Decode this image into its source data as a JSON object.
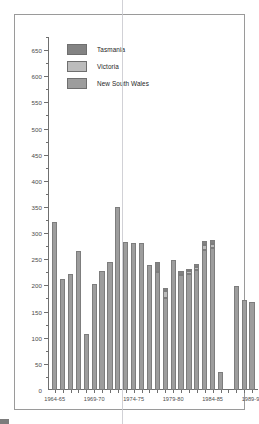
{
  "chart_data": {
    "type": "bar",
    "stacked": true,
    "title": "",
    "xlabel": "",
    "ylabel": "",
    "ylim": [
      0,
      675
    ],
    "ytick_step": 50,
    "yminor_step": 25,
    "grid": false,
    "legend_position": "top-left",
    "ytick_labels": [
      "50",
      "100",
      "150",
      "200",
      "250",
      "300",
      "350",
      "400",
      "450",
      "500",
      "550",
      "600",
      "650"
    ],
    "ytick_values": [
      50,
      100,
      150,
      200,
      250,
      300,
      350,
      400,
      450,
      500,
      550,
      600,
      650
    ],
    "xtick_labels": [
      "1964-65",
      "1969-70",
      "1974-75",
      "1979-80",
      "1984-85",
      "1989-90"
    ],
    "xtick_index": [
      0,
      5,
      10,
      15,
      20,
      25
    ],
    "categories": [
      "1964-65",
      "1965-66",
      "1966-67",
      "1967-68",
      "1968-69",
      "1969-70",
      "1970-71",
      "1971-72",
      "1972-73",
      "1973-74",
      "1974-75",
      "1975-76",
      "1976-77",
      "1977-78",
      "1978-79",
      "1979-80",
      "1980-81",
      "1981-82",
      "1982-83",
      "1983-84",
      "1984-85",
      "1985-86",
      "1986-87",
      "1987-88",
      "1988-89",
      "1989-90"
    ],
    "series": [
      {
        "name": "New South Wales",
        "color": "#9d9d9d",
        "values": [
          322,
          212,
          222,
          265,
          107,
          203,
          228,
          245,
          350,
          283,
          282,
          282,
          240,
          226,
          176,
          249,
          219,
          222,
          230,
          268,
          272,
          34,
          0,
          198,
          172,
          168
        ]
      },
      {
        "name": "Victoria",
        "color": "#bcbcbc",
        "values": [
          0,
          0,
          0,
          0,
          0,
          0,
          0,
          0,
          0,
          0,
          0,
          0,
          0,
          0,
          14,
          0,
          0,
          6,
          5,
          10,
          8,
          0,
          0,
          0,
          0,
          0
        ]
      },
      {
        "name": "Tasmania",
        "color": "#838383",
        "values": [
          0,
          0,
          0,
          0,
          0,
          0,
          0,
          0,
          0,
          0,
          0,
          0,
          0,
          18,
          6,
          0,
          8,
          4,
          6,
          7,
          6,
          0,
          0,
          0,
          0,
          0
        ]
      }
    ],
    "totals": [
      322,
      212,
      222,
      265,
      107,
      203,
      228,
      245,
      350,
      283,
      282,
      282,
      240,
      244,
      196,
      249,
      227,
      232,
      241,
      285,
      286,
      34,
      0,
      198,
      172,
      168
    ]
  },
  "legend": {
    "items": [
      {
        "label": "Tasmania",
        "swatch": "tas"
      },
      {
        "label": "Victoria",
        "swatch": "vic"
      },
      {
        "label": "New South Wales",
        "swatch": "nsw"
      }
    ]
  },
  "caption": {
    "text": ""
  }
}
